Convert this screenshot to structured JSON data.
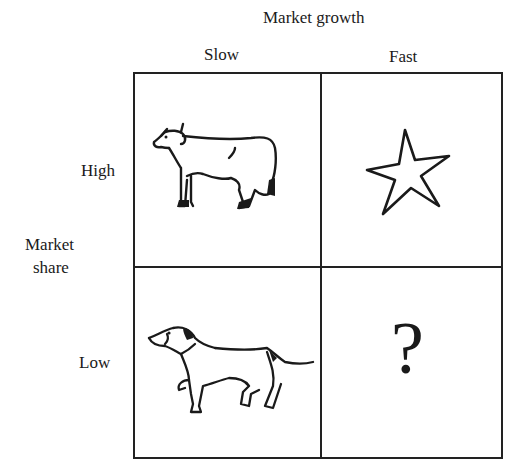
{
  "diagram": {
    "title": "Market growth",
    "columns": [
      {
        "label": "Slow"
      },
      {
        "label": "Fast"
      }
    ],
    "row_axis_label_line1": "Market",
    "row_axis_label_line2": "share",
    "rows": [
      {
        "label": "High"
      },
      {
        "label": "Low"
      }
    ],
    "quadrants": [
      {
        "position": "high-slow",
        "icon": "cow-icon"
      },
      {
        "position": "high-fast",
        "icon": "star-icon"
      },
      {
        "position": "low-slow",
        "icon": "dog-icon"
      },
      {
        "position": "low-fast",
        "icon": "question-mark-icon",
        "text": "?"
      }
    ],
    "line_color": "#222222"
  }
}
